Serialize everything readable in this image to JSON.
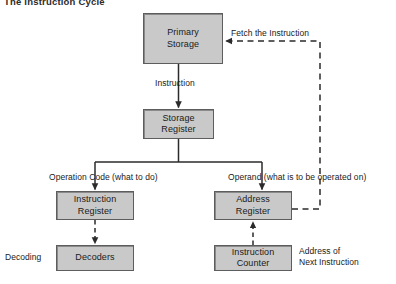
{
  "figure": {
    "title": "The Instruction Cycle",
    "type": "flowchart",
    "background_color": "#ffffff",
    "box_fill_color": "#c9c9c9",
    "box_border_color": "#5d5d5d",
    "line_color": "#2b2b2b",
    "text_color": "#1a1a1a"
  },
  "nodes": [
    {
      "id": "primary-storage",
      "label_line1": "Primary",
      "label_line2": "Storage",
      "x": 143,
      "y": 13,
      "w": 80,
      "h": 51
    },
    {
      "id": "storage-register",
      "label_line1": "Storage",
      "label_line2": "Register",
      "x": 143,
      "y": 109,
      "w": 71,
      "h": 30
    },
    {
      "id": "instruction-register",
      "label_line1": "Instruction",
      "label_line2": "Register",
      "x": 56,
      "y": 191,
      "w": 78,
      "h": 29
    },
    {
      "id": "decoders",
      "label_line1": "Decoders",
      "label_line2": "",
      "x": 56,
      "y": 245,
      "w": 78,
      "h": 26
    },
    {
      "id": "address-register",
      "label_line1": "Address",
      "label_line2": "Register",
      "x": 214,
      "y": 191,
      "w": 78,
      "h": 29
    },
    {
      "id": "instruction-counter",
      "label_line1": "Instruction",
      "label_line2": "Counter",
      "x": 214,
      "y": 245,
      "w": 78,
      "h": 26
    }
  ],
  "labels": [
    {
      "id": "fetch-the-instruction",
      "text": "Fetch the Instruction",
      "x": 231,
      "y": 28,
      "lines": [
        "Fetch the Instruction"
      ]
    },
    {
      "id": "instruction",
      "text": "Instruction",
      "x": 155,
      "y": 78,
      "lines": [
        "Instruction"
      ]
    },
    {
      "id": "operation-code",
      "text": "Operation Code (what to do)",
      "x": 49,
      "y": 172,
      "lines": [
        "Operation Code (what to do)"
      ]
    },
    {
      "id": "operand",
      "text": "Operand (what is to be operated on)",
      "x": 228,
      "y": 172,
      "lines": [
        "Operand (what is to be operated on)"
      ]
    },
    {
      "id": "decoding",
      "text": "Decoding",
      "x": 5,
      "y": 252,
      "lines": [
        "Decoding"
      ]
    },
    {
      "id": "address-of-next",
      "text": "Address of Next Instruction",
      "x": 299,
      "y": 246,
      "lines": [
        "Address of",
        "Next Instruction"
      ]
    }
  ],
  "connectors": [
    {
      "id": "primary-storage-to-storage-register",
      "style": "solid",
      "from": "primary-storage",
      "to": "storage-register",
      "arrow": true
    },
    {
      "id": "storage-register-fork",
      "style": "solid",
      "from": "storage-register",
      "to": "fork",
      "arrow": false
    },
    {
      "id": "fork-to-instruction-register",
      "style": "solid",
      "from": "fork",
      "to": "instruction-register",
      "arrow": true
    },
    {
      "id": "fork-to-address-register",
      "style": "solid",
      "from": "fork",
      "to": "address-register",
      "arrow": true
    },
    {
      "id": "instruction-register-to-decoders",
      "style": "dashed",
      "from": "instruction-register",
      "to": "decoders",
      "arrow": true
    },
    {
      "id": "instruction-counter-to-address-register",
      "style": "dashed",
      "from": "instruction-counter",
      "to": "address-register",
      "arrow": true
    },
    {
      "id": "address-register-to-primary-storage",
      "style": "dashed",
      "from": "address-register",
      "to": "primary-storage",
      "arrow": true
    }
  ]
}
